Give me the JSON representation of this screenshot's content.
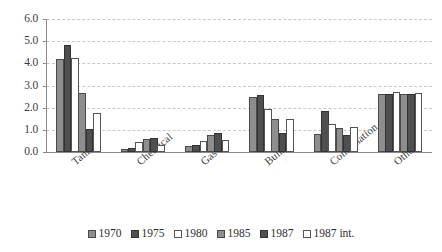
{
  "chart_data": {
    "type": "bar",
    "title": "",
    "subtitle": "",
    "xlabel": "",
    "ylabel": "",
    "ylim": [
      0.0,
      6.0
    ],
    "ytick_labels": [
      "0.0",
      "1.0",
      "2.0",
      "3.0",
      "4.0",
      "5.0",
      "6.0"
    ],
    "ytick_values": [
      0.0,
      1.0,
      2.0,
      3.0,
      4.0,
      5.0,
      6.0
    ],
    "grid": true,
    "grid_style": "dashed horizontal",
    "legend_position": "bottom-center",
    "categories": [
      "Tank",
      "Chemical",
      "Gas",
      "Bulk",
      "Combination",
      "Others"
    ],
    "series": [
      {
        "name": "1970",
        "values": [
          4.2,
          0.15,
          0.25,
          2.5,
          0.8,
          2.6
        ]
      },
      {
        "name": "1975",
        "values": [
          4.85,
          0.2,
          0.3,
          2.55,
          1.85,
          2.6
        ]
      },
      {
        "name": "1980",
        "values": [
          4.25,
          0.45,
          0.5,
          1.95,
          1.25,
          2.7
        ]
      },
      {
        "name": "1985",
        "values": [
          2.65,
          0.6,
          0.75,
          1.5,
          1.1,
          2.6
        ]
      },
      {
        "name": "1987",
        "values": [
          1.05,
          0.65,
          0.85,
          0.85,
          0.75,
          2.6
        ]
      },
      {
        "name": "1987 int.",
        "values": [
          1.75,
          0.3,
          0.55,
          1.5,
          1.15,
          2.65
        ]
      }
    ]
  },
  "legend": {
    "items": [
      {
        "label": "1970"
      },
      {
        "label": "1975"
      },
      {
        "label": "1980"
      },
      {
        "label": "1985"
      },
      {
        "label": "1987"
      },
      {
        "label": "1987 int."
      }
    ]
  },
  "colors": {
    "series_medium_gray": "#8e8e8e",
    "series_dark_gray": "#4f4f4f",
    "series_white": "#ffffff",
    "axis": "#8a8a8a",
    "gridline": "#c9c9c9",
    "text": "#2f2f2f",
    "background": "#ffffff"
  }
}
